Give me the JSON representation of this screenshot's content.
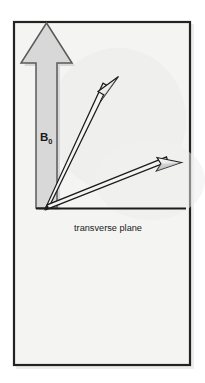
{
  "figure": {
    "canvas": {
      "width": 205,
      "height": 383
    },
    "colors": {
      "page_background": "#ffffff",
      "panel_background": "#f4f4f3",
      "panel_border": "#232323",
      "block_arrow_fill": "#d8d8d8",
      "block_arrow_stroke": "#4a4a4a",
      "vector_outline": "#1c1c1c",
      "vector_fill": "#f2f2f2",
      "axis_line": "#1c1c1c",
      "text": "#1a1a1a",
      "shadow": "#e2e2e2"
    },
    "panel": {
      "x": 13,
      "y": 21,
      "width": 178,
      "height": 345,
      "border_width": 2
    },
    "labels": {
      "b0": {
        "text": "B",
        "subscript": "0",
        "x": 42,
        "y": 141
      },
      "transverse_plane": {
        "text": "transverse plane",
        "x": 108,
        "y": 231
      }
    },
    "axis": {
      "name": "transverse-plane-axis",
      "x1": 36,
      "y1": 208,
      "x2": 186,
      "y2": 208,
      "stroke_width": 2.1
    },
    "block_arrow": {
      "name": "b0-field-arrow",
      "direction": "up",
      "origin_x": 47,
      "base_y": 208,
      "tip_y": 23,
      "shaft_half_width": 12,
      "head_half_width": 26,
      "head_base_y": 63,
      "points": "36,208 36,63 21,63 46.5,23 72,63 57,63 57,208"
    },
    "vectors": [
      {
        "name": "net-magnetization-vector",
        "origin_x": 47,
        "origin_y": 207,
        "tip_x": 118,
        "tip_y": 77,
        "angle_deg_from_transverse": 61,
        "shaft_half_width": 2.1,
        "head_length": 22,
        "head_half_width": 6.2
      },
      {
        "name": "transverse-magnetization-vector",
        "origin_x": 47,
        "origin_y": 207,
        "tip_x": 181,
        "tip_y": 163,
        "angle_deg_from_transverse": 18,
        "shaft_half_width": 2.1,
        "head_length": 22,
        "head_half_width": 6.2
      }
    ]
  }
}
